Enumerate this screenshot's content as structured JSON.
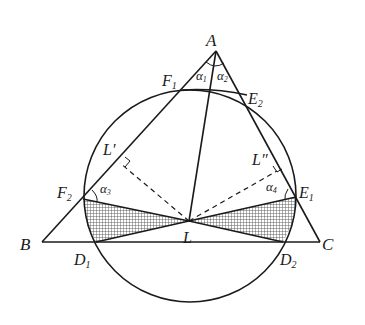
{
  "figure": {
    "type": "geometry-diagram",
    "points": {
      "A": {
        "label": "A",
        "x": 216,
        "y": 51
      },
      "B": {
        "label": "B",
        "x": 42,
        "y": 242
      },
      "C": {
        "label": "C",
        "x": 320,
        "y": 242
      },
      "L": {
        "label": "L",
        "x": 189,
        "y": 221
      },
      "F1": {
        "label": "F",
        "sub": "1",
        "x": 182,
        "y": 90
      },
      "E2": {
        "label": "E",
        "sub": "2",
        "x": 247,
        "y": 95
      },
      "F2": {
        "label": "F",
        "sub": "2",
        "x": 83,
        "y": 199
      },
      "E1": {
        "label": "E",
        "sub": "1",
        "x": 296,
        "y": 197
      },
      "D1": {
        "label": "D",
        "sub": "1",
        "x": 96,
        "y": 242
      },
      "D2": {
        "label": "D",
        "sub": "2",
        "x": 283,
        "y": 242
      },
      "Lp": {
        "label": "L′",
        "x": 120,
        "y": 163
      },
      "Lpp": {
        "label": "L″",
        "x": 276,
        "y": 171
      }
    },
    "angles": {
      "a1": {
        "label": "α",
        "sub": "1"
      },
      "a2": {
        "label": "α",
        "sub": "2"
      },
      "a3": {
        "label": "α",
        "sub": "3"
      },
      "a4": {
        "label": "α",
        "sub": "4"
      }
    },
    "circle": {
      "cx": 190,
      "cy": 196,
      "r": 106
    },
    "colors": {
      "ink": "#1a1a1a",
      "background": "#ffffff",
      "hatch": "#555555"
    }
  }
}
